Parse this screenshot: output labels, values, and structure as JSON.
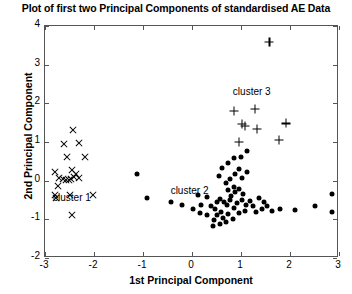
{
  "chart_data": {
    "type": "scatter",
    "title": "Plot of first two Principal Components of standardised AE Data",
    "xlabel": "1st Principal Component",
    "ylabel": "2nd Principal Component",
    "xlim": [
      -3,
      3
    ],
    "ylim": [
      -2,
      4
    ],
    "xticks": [
      -3,
      -2,
      -1,
      0,
      1,
      2,
      3
    ],
    "yticks": [
      -2,
      -1,
      0,
      1,
      2,
      3,
      4
    ],
    "xticklabels": [
      "-3",
      "-2",
      "-1",
      "0",
      "1",
      "2",
      "3"
    ],
    "yticklabels": [
      "-2",
      "-1",
      "0",
      "1",
      "2",
      "3",
      "4"
    ],
    "grid": false,
    "legend": "none",
    "annotations": [
      {
        "text": "cluster 1",
        "x": -2.45,
        "y": -0.42
      },
      {
        "text": "cluster 2",
        "x": -0.05,
        "y": -0.24
      },
      {
        "text": "cluster 3",
        "x": 1.22,
        "y": 2.32
      }
    ],
    "series": [
      {
        "name": "cluster 1",
        "marker": "x",
        "color": "#000000",
        "points": [
          [
            -2.42,
            1.3
          ],
          [
            -2.62,
            0.95
          ],
          [
            -2.3,
            0.98
          ],
          [
            -2.55,
            0.62
          ],
          [
            -2.18,
            0.6
          ],
          [
            -2.8,
            0.22
          ],
          [
            -2.45,
            0.28
          ],
          [
            -2.36,
            0.16
          ],
          [
            -2.72,
            0.06
          ],
          [
            -2.64,
            0.04
          ],
          [
            -2.58,
            0.02
          ],
          [
            -2.52,
            0.01
          ],
          [
            -2.46,
            0.05
          ],
          [
            -2.4,
            0.1
          ],
          [
            -2.3,
            0.08
          ],
          [
            -2.74,
            -0.14
          ],
          [
            -2.8,
            -0.36
          ],
          [
            -2.78,
            -0.44
          ],
          [
            -2.5,
            -0.36
          ],
          [
            -2.02,
            -0.36
          ],
          [
            -2.44,
            -0.88
          ]
        ]
      },
      {
        "name": "cluster 2",
        "marker": "o",
        "color": "#000000",
        "points": [
          [
            -1.12,
            0.18
          ],
          [
            -0.92,
            -0.44
          ],
          [
            -0.42,
            -0.56
          ],
          [
            -0.2,
            -0.64
          ],
          [
            0.12,
            -0.38
          ],
          [
            0.3,
            -0.42
          ],
          [
            0.18,
            -0.62
          ],
          [
            0.38,
            -0.66
          ],
          [
            0.52,
            -0.54
          ],
          [
            0.58,
            -0.48
          ],
          [
            0.46,
            -0.74
          ],
          [
            0.6,
            -0.8
          ],
          [
            0.72,
            -0.62
          ],
          [
            0.66,
            -0.56
          ],
          [
            0.78,
            -0.5
          ],
          [
            0.52,
            -0.9
          ],
          [
            0.64,
            -0.96
          ],
          [
            0.44,
            -1.02
          ],
          [
            0.3,
            -0.88
          ],
          [
            0.16,
            -0.84
          ],
          [
            0.02,
            -0.74
          ],
          [
            0.74,
            -0.86
          ],
          [
            0.86,
            -0.7
          ],
          [
            0.92,
            -0.58
          ],
          [
            0.8,
            -0.4
          ],
          [
            0.88,
            -0.3
          ],
          [
            0.74,
            -0.24
          ],
          [
            0.86,
            -0.16
          ],
          [
            0.96,
            -0.22
          ],
          [
            1.04,
            -0.34
          ],
          [
            1.02,
            -0.5
          ],
          [
            1.1,
            -0.62
          ],
          [
            1.18,
            -0.52
          ],
          [
            1.24,
            -0.66
          ],
          [
            1.08,
            -0.78
          ],
          [
            0.96,
            -0.84
          ],
          [
            0.84,
            -0.98
          ],
          [
            0.7,
            -1.06
          ],
          [
            0.58,
            -1.12
          ],
          [
            0.42,
            -1.18
          ],
          [
            1.3,
            -0.8
          ],
          [
            1.42,
            -0.72
          ],
          [
            1.54,
            -0.66
          ],
          [
            1.46,
            -0.54
          ],
          [
            1.36,
            -0.44
          ],
          [
            0.62,
            0.32
          ],
          [
            0.74,
            0.46
          ],
          [
            0.86,
            0.58
          ],
          [
            0.96,
            0.3
          ],
          [
            0.88,
            0.16
          ],
          [
            0.78,
            0.04
          ],
          [
            0.7,
            -0.06
          ],
          [
            1.02,
            0.08
          ],
          [
            1.12,
            0.22
          ],
          [
            1.0,
            0.62
          ],
          [
            1.12,
            0.76
          ],
          [
            0.56,
            0.12
          ],
          [
            1.64,
            -0.78
          ],
          [
            1.8,
            -0.74
          ],
          [
            2.1,
            -0.76
          ],
          [
            2.5,
            -0.66
          ],
          [
            2.86,
            -0.34
          ],
          [
            2.86,
            -0.8
          ]
        ]
      },
      {
        "name": "cluster 3",
        "marker": "+",
        "color": "#000000",
        "points": [
          [
            1.58,
            3.58
          ],
          [
            0.86,
            1.8
          ],
          [
            1.28,
            1.86
          ],
          [
            1.02,
            1.46
          ],
          [
            1.08,
            1.42
          ],
          [
            1.32,
            1.34
          ],
          [
            0.96,
            1.0
          ],
          [
            1.78,
            1.06
          ],
          [
            1.92,
            1.48
          ]
        ]
      }
    ]
  }
}
